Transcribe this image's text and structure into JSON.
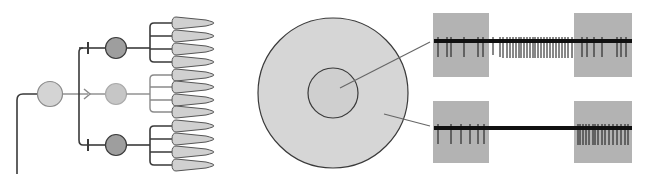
{
  "figure": {
    "colors": {
      "background": "#ffffff",
      "line_dark": "#3a3a3a",
      "line_light": "#8a8a8a",
      "cell_light": "#d4d4d4",
      "cell_mid": "#c6c6c6",
      "cell_dark": "#9e9e9e",
      "receptor_fill": "#d0d0d0",
      "disc_fill": "#d6d6d6",
      "stim_box": "#b3b3b3",
      "spike": "#111111"
    }
  },
  "circuit": {
    "input_neuron": {
      "label": "input-neuron",
      "type": "light"
    },
    "branches": [
      {
        "label": "top-branch",
        "synapse": "inhibitory",
        "neuron": "dark",
        "receptors": 4
      },
      {
        "label": "middle-branch",
        "synapse": "excitatory",
        "neuron": "light",
        "receptors": 4
      },
      {
        "label": "bottom-branch",
        "synapse": "inhibitory",
        "neuron": "dark",
        "receptors": 4
      }
    ]
  },
  "receptive_field": {
    "outer": "surround",
    "inner": "center"
  },
  "recordings": [
    {
      "label": "center-recording",
      "source": "center",
      "stim_boxes": [
        "before",
        "after"
      ],
      "pattern": "sparse spikes during boxes, dense burst between"
    },
    {
      "label": "surround-recording",
      "source": "surround",
      "stim_boxes": [
        "before",
        "after"
      ],
      "pattern": "sparse spikes in first box, silence between, dense burst in second box"
    }
  ]
}
